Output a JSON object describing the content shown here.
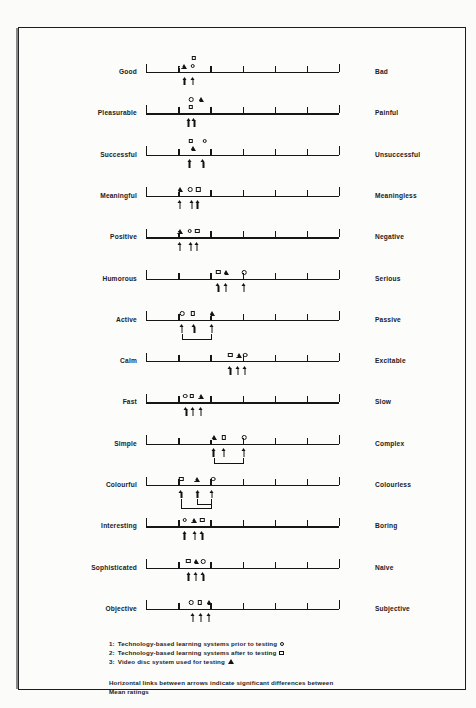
{
  "chart_data": {
    "type": "scatter",
    "title": "",
    "subtitle": "",
    "xlabel": "",
    "ylabel": "",
    "scale": {
      "points": 7,
      "min": 1,
      "max": 7,
      "tick_labels": [
        "1",
        "2",
        "3",
        "4",
        "5",
        "6",
        "7"
      ],
      "grid": false
    },
    "legend_position": "bottom-left",
    "series": [
      {
        "name": "Technology-based learning systems prior to testing",
        "key": "prior",
        "symbol": "circle",
        "legend_number": "1"
      },
      {
        "name": "Technology-based learning systems after to testing",
        "key": "after",
        "symbol": "square",
        "legend_number": "2"
      },
      {
        "name": "Video disc system used for testing",
        "key": "video",
        "symbol": "triangle",
        "legend_number": "3"
      }
    ],
    "categories": [
      "Good",
      "Pleasurable",
      "Successful",
      "Meaningful",
      "Positive",
      "Humorous",
      "Active",
      "Calm",
      "Fast",
      "Simple",
      "Colourful",
      "Interesting",
      "Sophisticated",
      "Objective"
    ],
    "rows": [
      {
        "left": "Good",
        "right": "Bad",
        "markers": [
          {
            "series": "video",
            "symbol": "triangle",
            "value": 2.18,
            "tier": 0
          },
          {
            "series": "prior",
            "symbol": "circle",
            "value": 2.45,
            "tier": 0
          },
          {
            "series": "after",
            "symbol": "square",
            "value": 2.48,
            "tier": 1
          }
        ],
        "arrows": [
          2.2,
          2.46
        ],
        "links": []
      },
      {
        "left": "Pleasurable",
        "right": "Painful",
        "markers": [
          {
            "series": "prior",
            "symbol": "circle",
            "value": 2.4,
            "tier": 1
          },
          {
            "series": "video",
            "symbol": "triangle",
            "value": 2.72,
            "tier": 1
          },
          {
            "series": "after",
            "symbol": "square",
            "value": 2.4,
            "tier": 0
          }
        ],
        "arrows": [
          2.32,
          2.5
        ],
        "links": []
      },
      {
        "left": "Successful",
        "right": "Unsuccessful",
        "markers": [
          {
            "series": "after",
            "symbol": "square",
            "value": 2.4,
            "tier": 1
          },
          {
            "series": "prior",
            "symbol": "circle",
            "value": 2.82,
            "tier": 1
          },
          {
            "series": "video",
            "symbol": "triangle",
            "value": 2.45,
            "tier": 0
          }
        ],
        "arrows": [
          2.35,
          2.78
        ],
        "links": []
      },
      {
        "left": "Meaningful",
        "right": "Meaningless",
        "markers": [
          {
            "series": "video",
            "symbol": "triangle",
            "value": 2.05,
            "tier": 0
          },
          {
            "series": "prior",
            "symbol": "circle",
            "value": 2.38,
            "tier": 0
          },
          {
            "series": "after",
            "symbol": "square",
            "value": 2.62,
            "tier": 0
          }
        ],
        "arrows": [
          2.05,
          2.42,
          2.6
        ],
        "links": []
      },
      {
        "left": "Positive",
        "right": "Negative",
        "markers": [
          {
            "series": "video",
            "symbol": "triangle",
            "value": 2.05,
            "tier": 0
          },
          {
            "series": "prior",
            "symbol": "circle",
            "value": 2.36,
            "tier": 0
          },
          {
            "series": "after",
            "symbol": "square",
            "value": 2.6,
            "tier": 0
          }
        ],
        "arrows": [
          2.05,
          2.4,
          2.58
        ],
        "links": []
      },
      {
        "left": "Humorous",
        "right": "Serious",
        "markers": [
          {
            "series": "after",
            "symbol": "square",
            "value": 3.25,
            "tier": 0
          },
          {
            "series": "video",
            "symbol": "triangle",
            "value": 3.5,
            "tier": 0
          },
          {
            "series": "prior",
            "symbol": "circle",
            "value": 4.05,
            "tier": 0
          }
        ],
        "arrows": [
          3.25,
          3.48,
          4.05
        ],
        "links": []
      },
      {
        "left": "Active",
        "right": "Passive",
        "markers": [
          {
            "series": "prior",
            "symbol": "circle",
            "value": 2.12,
            "tier": 0
          },
          {
            "series": "after",
            "symbol": "square",
            "value": 2.45,
            "tier": 0
          },
          {
            "series": "video",
            "symbol": "triangle",
            "value": 3.05,
            "tier": 0
          }
        ],
        "arrows": [
          2.12,
          2.5,
          3.05
        ],
        "links": [
          {
            "from": 2.12,
            "to": 3.05,
            "depth": 1
          }
        ]
      },
      {
        "left": "Calm",
        "right": "Excitable",
        "markers": [
          {
            "series": "after",
            "symbol": "square",
            "value": 3.62,
            "tier": 0
          },
          {
            "series": "video",
            "symbol": "triangle",
            "value": 3.88,
            "tier": 0
          },
          {
            "series": "prior",
            "symbol": "circle",
            "value": 4.08,
            "tier": 0
          }
        ],
        "arrows": [
          3.62,
          3.86,
          4.08
        ],
        "links": []
      },
      {
        "left": "Fast",
        "right": "Slow",
        "markers": [
          {
            "series": "prior",
            "symbol": "circle",
            "value": 2.22,
            "tier": 0
          },
          {
            "series": "after",
            "symbol": "square",
            "value": 2.42,
            "tier": 0
          },
          {
            "series": "video",
            "symbol": "triangle",
            "value": 2.72,
            "tier": 0
          }
        ],
        "arrows": [
          2.25,
          2.45,
          2.7
        ],
        "links": []
      },
      {
        "left": "Simple",
        "right": "Complex",
        "markers": [
          {
            "series": "video",
            "symbol": "triangle",
            "value": 3.1,
            "tier": 0
          },
          {
            "series": "after",
            "symbol": "square",
            "value": 3.42,
            "tier": 0
          },
          {
            "series": "prior",
            "symbol": "circle",
            "value": 4.05,
            "tier": 0
          }
        ],
        "arrows": [
          3.1,
          3.42,
          4.05
        ],
        "links": [
          {
            "from": 3.1,
            "to": 4.05,
            "depth": 1
          }
        ]
      },
      {
        "left": "Colourful",
        "right": "Colourless",
        "markers": [
          {
            "series": "after",
            "symbol": "square",
            "value": 2.1,
            "tier": 0
          },
          {
            "series": "video",
            "symbol": "triangle",
            "value": 2.6,
            "tier": 0
          },
          {
            "series": "prior",
            "symbol": "circle",
            "value": 3.08,
            "tier": 0
          }
        ],
        "arrows": [
          2.1,
          2.6,
          3.05
        ],
        "links": [
          {
            "from": 2.1,
            "to": 3.05,
            "depth": 2
          },
          {
            "from": 2.6,
            "to": 3.05,
            "depth": 1
          }
        ]
      },
      {
        "left": "Interesting",
        "right": "Boring",
        "markers": [
          {
            "series": "prior",
            "symbol": "circle",
            "value": 2.2,
            "tier": 0
          },
          {
            "series": "video",
            "symbol": "triangle",
            "value": 2.48,
            "tier": 0
          },
          {
            "series": "after",
            "symbol": "square",
            "value": 2.75,
            "tier": 0
          }
        ],
        "arrows": [
          2.2,
          2.52,
          2.75
        ],
        "links": []
      },
      {
        "left": "Sophisticated",
        "right": "Naive",
        "markers": [
          {
            "series": "after",
            "symbol": "square",
            "value": 2.32,
            "tier": 0
          },
          {
            "series": "video",
            "symbol": "triangle",
            "value": 2.55,
            "tier": 0
          },
          {
            "series": "prior",
            "symbol": "circle",
            "value": 2.78,
            "tier": 0
          }
        ],
        "arrows": [
          2.32,
          2.55,
          2.78
        ],
        "links": []
      },
      {
        "left": "Objective",
        "right": "Subjective",
        "markers": [
          {
            "series": "prior",
            "symbol": "circle",
            "value": 2.4,
            "tier": 0
          },
          {
            "series": "after",
            "symbol": "square",
            "value": 2.68,
            "tier": 0
          },
          {
            "series": "video",
            "symbol": "triangle",
            "value": 2.95,
            "tier": 0
          }
        ],
        "arrows": [
          2.45,
          2.7,
          2.95
        ],
        "links": []
      }
    ],
    "annotations": [
      "1: Technology-based learning systems prior to testing  o",
      "2: Technology-based learning systems after to testing  □",
      "3: Video disc system used for testing  △",
      "Horizontal links between arrows indicate significant differences between Mean ratings"
    ]
  },
  "legend": {
    "items": [
      {
        "number": "1:",
        "text": "Technology-based learning systems prior to testing",
        "symbol": "circle"
      },
      {
        "number": "2:",
        "text": "Technology-based learning systems after to testing",
        "symbol": "square"
      },
      {
        "number": "3:",
        "text": "Video disc system used for testing",
        "symbol": "triangle"
      }
    ],
    "note_line1": "Horizontal links between arrows indicate significant differences between",
    "note_line2": "Mean ratings"
  },
  "colors": {
    "ink": "#141414",
    "page": "#fcfcfb",
    "frame": "#1c1c1c"
  }
}
